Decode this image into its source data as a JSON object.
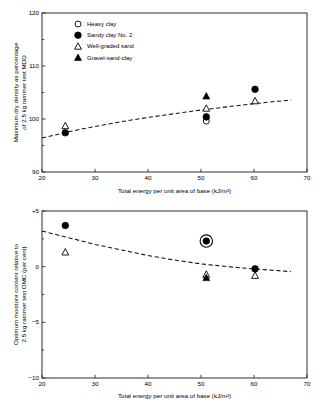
{
  "figure": {
    "background_color": "#ffffff",
    "ink_color": "#000000"
  },
  "charts": {
    "top": {
      "xlabel": "Total energy per unit area of base (kJ/m²)",
      "ylabel_line1": "Maximum dry density as percentage",
      "ylabel_line2": "of 2.5 kg rammer test MDD",
      "xticks": [
        "20",
        "30",
        "40",
        "50",
        "60",
        "70"
      ],
      "yticks": [
        "90",
        "100",
        "110",
        "120"
      ],
      "legend": [
        {
          "label": "Heavy clay",
          "marker": "open-circle"
        },
        {
          "label": "Sandy clay No. 2",
          "marker": "filled-circle"
        },
        {
          "label": "Well-graded sand",
          "marker": "open-triangle"
        },
        {
          "label": "Gravel-sand-clay",
          "marker": "filled-triangle"
        }
      ]
    },
    "bottom": {
      "xlabel": "Total energy per unit area of base (kJ/m²)",
      "ylabel_line1": "Optimum moisture content relative to",
      "ylabel_line2": "2.5 kg rammer test OMC (per cent)",
      "xticks": [
        "20",
        "30",
        "40",
        "50",
        "60",
        "70"
      ],
      "yticks": [
        "+5",
        "0",
        "−5",
        "−10"
      ]
    }
  },
  "chart_data": [
    {
      "type": "scatter",
      "title": "",
      "xlabel": "Total energy per unit area of base (kJ/m²)",
      "ylabel": "Maximum dry density as percentage of 2.5 kg rammer test MDD",
      "xlim": [
        20,
        70
      ],
      "ylim": [
        90,
        120
      ],
      "xticks": [
        20,
        30,
        40,
        50,
        60,
        70
      ],
      "yticks": [
        90,
        100,
        110,
        120
      ],
      "minor_yticks": [
        95,
        105,
        115
      ],
      "grid": false,
      "legend_position": "upper-left-inside",
      "series": [
        {
          "name": "Heavy clay",
          "marker": "open-circle",
          "points": [
            {
              "x": 51.0,
              "y": 99.6
            }
          ]
        },
        {
          "name": "Sandy clay No. 2",
          "marker": "filled-circle",
          "points": [
            {
              "x": 24.4,
              "y": 97.4
            },
            {
              "x": 51.0,
              "y": 100.4
            },
            {
              "x": 60.2,
              "y": 105.6
            }
          ]
        },
        {
          "name": "Well-graded sand",
          "marker": "open-triangle",
          "points": [
            {
              "x": 24.4,
              "y": 98.7
            },
            {
              "x": 51.0,
              "y": 102.0
            },
            {
              "x": 60.2,
              "y": 103.4
            }
          ]
        },
        {
          "name": "Gravel-sand-clay",
          "marker": "filled-triangle",
          "points": [
            {
              "x": 51.0,
              "y": 104.3
            }
          ]
        }
      ],
      "trend_line": {
        "style": "dashed",
        "points": [
          {
            "x": 20.0,
            "y": 96.4
          },
          {
            "x": 25.0,
            "y": 97.6
          },
          {
            "x": 30.0,
            "y": 98.6
          },
          {
            "x": 35.0,
            "y": 99.5
          },
          {
            "x": 40.0,
            "y": 100.3
          },
          {
            "x": 45.0,
            "y": 101.0
          },
          {
            "x": 50.0,
            "y": 101.7
          },
          {
            "x": 55.0,
            "y": 102.3
          },
          {
            "x": 60.0,
            "y": 102.9
          },
          {
            "x": 67.0,
            "y": 103.6
          }
        ]
      }
    },
    {
      "type": "scatter",
      "title": "",
      "xlabel": "Total energy per unit area of base (kJ/m²)",
      "ylabel": "Optimum moisture content relative to 2.5 kg rammer test OMC (per cent)",
      "xlim": [
        20,
        70
      ],
      "ylim": [
        -10,
        5
      ],
      "xticks": [
        20,
        30,
        40,
        50,
        60,
        70
      ],
      "yticks": [
        5,
        0,
        -5,
        -10
      ],
      "ytick_labels": [
        "+5",
        "0",
        "−5",
        "−10"
      ],
      "grid": false,
      "legend_position": "none",
      "series": [
        {
          "name": "Sandy clay No. 2",
          "marker": "filled-circle",
          "points": [
            {
              "x": 24.4,
              "y": 3.7
            },
            {
              "x": 51.0,
              "y": 2.3,
              "highlight_ring": true
            },
            {
              "x": 60.2,
              "y": -0.2
            }
          ]
        },
        {
          "name": "Well-graded sand",
          "marker": "open-triangle",
          "points": [
            {
              "x": 24.4,
              "y": 1.3
            },
            {
              "x": 51.0,
              "y": -0.7
            },
            {
              "x": 60.2,
              "y": -0.8
            }
          ]
        },
        {
          "name": "Gravel-sand-clay",
          "marker": "filled-triangle",
          "points": [
            {
              "x": 51.0,
              "y": -1.0
            }
          ]
        }
      ],
      "trend_line": {
        "style": "dashed",
        "points": [
          {
            "x": 20.0,
            "y": 3.2
          },
          {
            "x": 25.0,
            "y": 2.6
          },
          {
            "x": 30.0,
            "y": 2.0
          },
          {
            "x": 35.0,
            "y": 1.5
          },
          {
            "x": 40.0,
            "y": 1.0
          },
          {
            "x": 45.0,
            "y": 0.6
          },
          {
            "x": 50.0,
            "y": 0.25
          },
          {
            "x": 55.0,
            "y": 0.0
          },
          {
            "x": 60.0,
            "y": -0.2
          },
          {
            "x": 67.0,
            "y": -0.45
          }
        ]
      }
    }
  ]
}
